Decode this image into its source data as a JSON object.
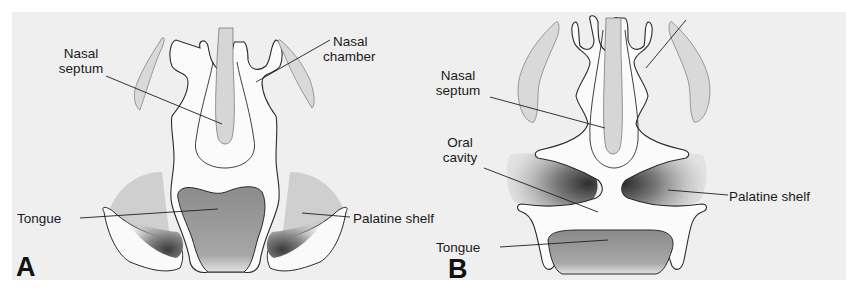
{
  "figure": {
    "panels": [
      {
        "id": "A",
        "letter": "A",
        "labels": {
          "nasal_septum_1": "Nasal",
          "nasal_septum_2": "septum",
          "nasal_chamber_1": "Nasal",
          "nasal_chamber_2": "chamber",
          "tongue": "Tongue",
          "palatine_shelf": "Palatine shelf"
        }
      },
      {
        "id": "B",
        "letter": "B",
        "labels": {
          "nasal_septum_1": "Nasal",
          "nasal_septum_2": "septum",
          "oral_cavity_1": "Oral",
          "oral_cavity_2": "cavity",
          "palatine_shelf": "Palatine shelf",
          "tongue": "Tongue"
        }
      }
    ],
    "colors": {
      "background": "#efefef",
      "page": "#ffffff",
      "outline": "#2a2a2a",
      "light_stipple": "#d6d6d6",
      "mid_stipple": "#9a9a9a",
      "dark_stipple": "#555555"
    }
  }
}
